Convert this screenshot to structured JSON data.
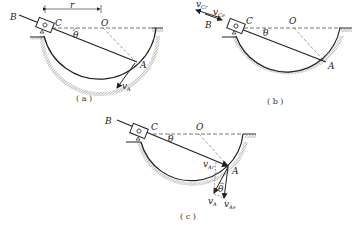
{
  "figures": [
    {
      "id": "a",
      "caption": "( a )",
      "labels": {
        "B": "B",
        "C": "C",
        "r": "r",
        "O": "O",
        "theta": "θ",
        "A": "A",
        "vA": "v",
        "vA_sub": "A"
      }
    },
    {
      "id": "b",
      "caption": "( b )",
      "labels": {
        "vCr": "v",
        "vCr_sub": "Cr",
        "vCe": "v",
        "vCe_sub": "Ce",
        "B": "B",
        "C": "C",
        "O": "O",
        "theta": "θ",
        "A": "A"
      }
    },
    {
      "id": "c",
      "caption": "( c )",
      "labels": {
        "B": "B",
        "C": "C",
        "O": "O",
        "theta": "θ",
        "vAr": "v",
        "vAr_sub": "Ar",
        "A": "A",
        "vA": "v",
        "vA_sub": "A",
        "theta2": "θ",
        "vAe": "v",
        "vAe_sub": "Ae"
      }
    }
  ],
  "colors": {
    "line": "#222222",
    "hatch": "#888888",
    "dashed": "#555555"
  }
}
